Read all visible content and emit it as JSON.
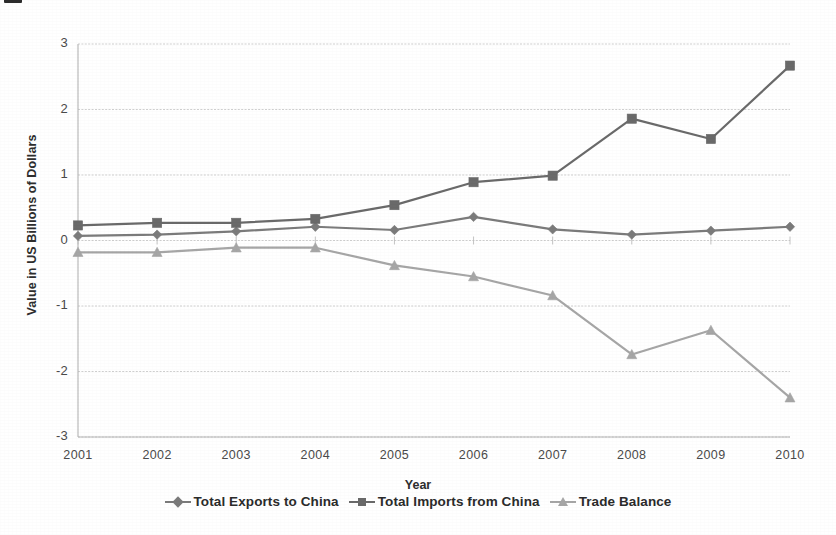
{
  "figure": {
    "caption_stub": "",
    "background_color": "#ffffff"
  },
  "chart_data": {
    "type": "line",
    "title": "",
    "xlabel": "Year",
    "ylabel": "Value in US Billions of Dollars",
    "categories": [
      "2001",
      "2002",
      "2003",
      "2004",
      "2005",
      "2006",
      "2007",
      "2008",
      "2009",
      "2010"
    ],
    "x": [
      2001,
      2002,
      2003,
      2004,
      2005,
      2006,
      2007,
      2008,
      2009,
      2010
    ],
    "xlim": [
      2001,
      2010
    ],
    "ylim": [
      -3,
      3
    ],
    "yticks": [
      "3",
      "2",
      "1",
      "0",
      "-1",
      "-2",
      "-3"
    ],
    "ytick_values": [
      3,
      2,
      1,
      0,
      -1,
      -2,
      -3
    ],
    "grid": true,
    "grid_axis": "y",
    "legend_position": "bottom",
    "series": [
      {
        "name": "Total Exports to China",
        "marker": "diamond",
        "color": "#7b7b7b",
        "values": [
          0.07,
          0.09,
          0.14,
          0.21,
          0.16,
          0.36,
          0.17,
          0.09,
          0.15,
          0.21
        ]
      },
      {
        "name": "Total Imports from China",
        "marker": "square",
        "color": "#6a6a6a",
        "values": [
          0.23,
          0.27,
          0.27,
          0.33,
          0.54,
          0.89,
          0.99,
          1.86,
          1.55,
          2.67
        ]
      },
      {
        "name": "Trade Balance",
        "marker": "triangle",
        "color": "#a6a6a6",
        "values": [
          -0.18,
          -0.18,
          -0.11,
          -0.11,
          -0.38,
          -0.55,
          -0.84,
          -1.74,
          -1.37,
          -2.4
        ]
      }
    ]
  },
  "legend": {
    "items": [
      {
        "label": "Total Exports to China",
        "marker": "diamond",
        "color": "#7b7b7b"
      },
      {
        "label": "Total Imports from China",
        "marker": "square",
        "color": "#6a6a6a"
      },
      {
        "label": "Trade Balance",
        "marker": "triangle",
        "color": "#a6a6a6"
      }
    ]
  },
  "axes": {
    "y_ticks": [
      "3",
      "2",
      "1",
      "0",
      "-1",
      "-2",
      "-3"
    ],
    "x_ticks": [
      "2001",
      "2002",
      "2003",
      "2004",
      "2005",
      "2006",
      "2007",
      "2008",
      "2009",
      "2010"
    ],
    "x_title": "Year",
    "y_title": "Value in US Billions of Dollars"
  }
}
